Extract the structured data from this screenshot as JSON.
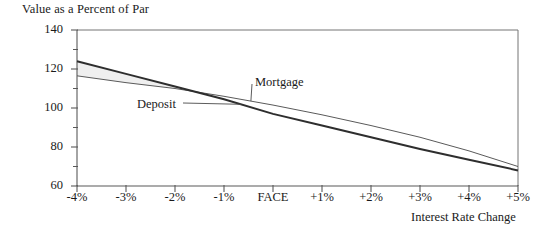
{
  "figure": {
    "background": "#ffffff",
    "frame_color": "#6d6d6d",
    "axis_color": "#6d6d6d"
  },
  "chart_data": {
    "type": "line",
    "title": "",
    "ylabel": "Value as a Percent of Par",
    "xlabel": "Interest Rate Change",
    "categories": [
      "-4%",
      "-3%",
      "-2%",
      "-1%",
      "FACE",
      "+1%",
      "+2%",
      "+3%",
      "+4%",
      "+5%"
    ],
    "x": [
      -4,
      -3,
      -2,
      -1,
      0,
      1,
      2,
      3,
      4,
      5
    ],
    "ylim": [
      60,
      140
    ],
    "xlim": [
      -4,
      5
    ],
    "yticks": [
      60,
      80,
      100,
      120,
      140
    ],
    "ytick_labels": [
      "60",
      "80",
      "100",
      "120",
      "140"
    ],
    "yminor_ticks": [
      70,
      90,
      110,
      130
    ],
    "grid": false,
    "legend": "inline-annotations",
    "shaded_region": {
      "label": "area between Deposit and Mortgage",
      "color": "#eeeeee"
    },
    "series": [
      {
        "name": "Deposit",
        "style": "thick",
        "color": "#333333",
        "width": 2.0,
        "values": [
          124,
          117.5,
          111,
          104.5,
          97,
          91,
          85,
          79,
          73.5,
          68
        ]
      },
      {
        "name": "Mortgage",
        "style": "thin",
        "color": "#555555",
        "width": 1.0,
        "values": [
          116.5,
          113,
          110,
          106,
          101.5,
          96.5,
          91,
          85,
          78,
          70
        ]
      }
    ],
    "annotations": [
      {
        "text": "Mortgage",
        "x": 2,
        "y": 113,
        "leader_to_series": "Mortgage"
      },
      {
        "text": "Deposit",
        "x": -1.1,
        "y": 102,
        "leader_to_series": "Deposit"
      }
    ]
  },
  "axes": {
    "y_tick_labels": [
      "140",
      "120",
      "100",
      "80",
      "60"
    ],
    "x_tick_labels": [
      "-4%",
      "-3%",
      "-2%",
      "-1%",
      "FACE",
      "+1%",
      "+2%",
      "+3%",
      "+4%",
      "+5%"
    ],
    "y_axis_title": "Value as a Percent of Par",
    "x_axis_title": "Interest Rate Change"
  },
  "labels": {
    "mortgage": "Mortgage",
    "deposit": "Deposit"
  }
}
